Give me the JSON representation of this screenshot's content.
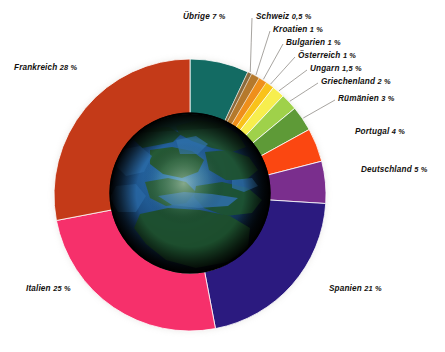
{
  "chart_data": {
    "type": "pie",
    "title": "",
    "subtitle": "",
    "xlabel": "",
    "ylabel": "",
    "legend_position": "callout-labels",
    "grid": false,
    "donut": true,
    "inner_radius_ratio": 0.575,
    "start_angle_deg": 0,
    "direction": "clockwise",
    "center_image": "globe-europe",
    "unit": "%",
    "decimal_separator": ",",
    "categories": [
      "Übrige",
      "Schweiz",
      "Kroatien",
      "Bulgarien",
      "Österreich",
      "Ungarn",
      "Griechenland",
      "Rümänien",
      "Portugal",
      "Deutschland",
      "Spanien",
      "Italien",
      "Frankreich"
    ],
    "values": [
      7,
      0.5,
      1,
      1,
      1,
      1.5,
      2,
      3,
      4,
      5,
      21,
      25,
      28
    ],
    "value_texts": [
      "7 %",
      "0,5 %",
      "1 %",
      "1 %",
      "1 %",
      "1,5 %",
      "2 %",
      "3 %",
      "4 %",
      "5 %",
      "21 %",
      "25 %",
      "28 %"
    ],
    "colors": [
      "#136b63",
      "#8a6a3c",
      "#b5792c",
      "#ef8f1b",
      "#f9c21a",
      "#f7ee4e",
      "#9fd14a",
      "#5e9a37",
      "#fb4711",
      "#7a2e8d",
      "#2b1a7f",
      "#f6306b",
      "#c43a18",
      "#2baedc"
    ],
    "slices": [
      {
        "label": "Übrige",
        "value": 7,
        "value_text": "7 %",
        "color": "#136b63"
      },
      {
        "label": "Schweiz",
        "value": 0.5,
        "value_text": "0,5 %",
        "color": "#8a6a3c"
      },
      {
        "label": "Kroatien",
        "value": 1,
        "value_text": "1 %",
        "color": "#b5792c"
      },
      {
        "label": "Bulgarien",
        "value": 1,
        "value_text": "1 %",
        "color": "#ef8f1b"
      },
      {
        "label": "Österreich",
        "value": 1,
        "value_text": "1 %",
        "color": "#f9c21a"
      },
      {
        "label": "Ungarn",
        "value": 1.5,
        "value_text": "1,5 %",
        "color": "#f7ee4e"
      },
      {
        "label": "Griechenland",
        "value": 2,
        "value_text": "2 %",
        "color": "#9fd14a"
      },
      {
        "label": "Rümänien",
        "value": 3,
        "value_text": "3 %",
        "color": "#5e9a37"
      },
      {
        "label": "Portugal",
        "value": 4,
        "value_text": "4 %",
        "color": "#fb4711"
      },
      {
        "label": "Deutschland",
        "value": 5,
        "value_text": "5 %",
        "color": "#7a2e8d"
      },
      {
        "label": "Spanien",
        "value": 21,
        "value_text": "21 %",
        "color": "#2b1a7f"
      },
      {
        "label": "Italien",
        "value": 25,
        "value_text": "25 %",
        "color": "#f6306b"
      },
      {
        "label": "Frankreich",
        "value": 28,
        "value_text": "28 %",
        "color": "#c43a18"
      }
    ]
  },
  "labels": {
    "uebrige": {
      "name": "Übrige",
      "pct": "7 %"
    },
    "schweiz": {
      "name": "Schweiz",
      "pct": "0,5 %"
    },
    "kroatien": {
      "name": "Kroatien",
      "pct": "1 %"
    },
    "bulgarien": {
      "name": "Bulgarien",
      "pct": "1 %"
    },
    "oesterreich": {
      "name": "Österreich",
      "pct": "1 %"
    },
    "ungarn": {
      "name": "Ungarn",
      "pct": "1,5 %"
    },
    "griechenland": {
      "name": "Griechenland",
      "pct": "2 %"
    },
    "ruemaenien": {
      "name": "Rümänien",
      "pct": "3 %"
    },
    "portugal": {
      "name": "Portugal",
      "pct": "4 %"
    },
    "deutschland": {
      "name": "Deutschland",
      "pct": "5 %"
    },
    "spanien": {
      "name": "Spanien",
      "pct": "21 %"
    },
    "italien": {
      "name": "Italien",
      "pct": "25 %"
    },
    "frankreich": {
      "name": "Frankreich",
      "pct": "28 %"
    }
  }
}
